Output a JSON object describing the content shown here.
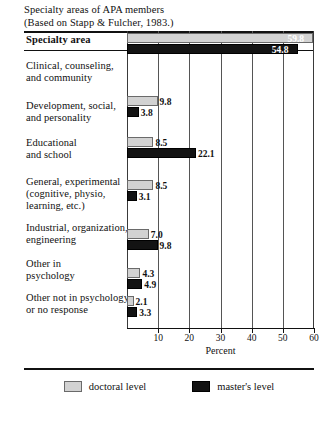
{
  "title": {
    "line1": "Specialty areas of APA members",
    "line2": "(Based on Stapp & Fulcher, 1983.)"
  },
  "header": {
    "specialty_area": "Specialty area"
  },
  "legend": {
    "doctoral_label": "doctoral level",
    "masters_label": "master's level",
    "doctoral_color": "#d2d2d2",
    "masters_color": "#131313"
  },
  "chart_data": {
    "type": "bar",
    "orientation": "horizontal",
    "title": "Specialty areas of APA members",
    "subtitle": "(Based on Stapp & Fulcher, 1983.)",
    "xlabel": "Percent",
    "ylabel": "Specialty area",
    "xlim": [
      0,
      60
    ],
    "xticks": [
      10,
      20,
      30,
      40,
      50,
      60
    ],
    "xtick_labels": [
      "10",
      "20",
      "30",
      "40",
      "50",
      "60"
    ],
    "grid": true,
    "legend_position": "bottom",
    "categories": [
      [
        "Clinical, counseling,",
        "and community"
      ],
      [
        "Development, social,",
        "and personality"
      ],
      [
        "Educational",
        "and school"
      ],
      [
        "General, experimental",
        "(cognitive, physio,",
        "learning, etc.)"
      ],
      [
        "Industrial, organization,",
        "engineering"
      ],
      [
        "Other in",
        "psychology"
      ],
      [
        "Other not in psychology",
        "or no response"
      ]
    ],
    "series": [
      {
        "name": "doctoral level",
        "color": "#d2d2d2",
        "values": [
          59.8,
          9.8,
          8.5,
          8.5,
          7.0,
          4.3,
          2.1
        ],
        "labels": [
          "59.8",
          "9.8",
          "8.5",
          "8.5",
          "7.0",
          "4.3",
          "2.1"
        ]
      },
      {
        "name": "master's level",
        "color": "#131313",
        "values": [
          54.8,
          3.8,
          22.1,
          3.1,
          9.8,
          4.9,
          3.3
        ],
        "labels": [
          "54.8",
          "3.8",
          "22.1",
          "3.1",
          "9.8",
          "4.9",
          "3.3"
        ]
      }
    ]
  }
}
